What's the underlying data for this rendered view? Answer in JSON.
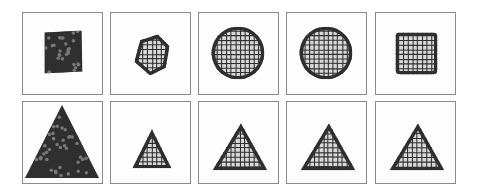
{
  "figure": {
    "ink_color": "#2f2f2f",
    "frame_color": "#8a8a8a",
    "rows": [
      {
        "target_shape": "square-to-circle",
        "panels": [
          {
            "x": 22,
            "y": 12,
            "shape": "noisy-square",
            "stage": "random"
          },
          {
            "x": 110,
            "y": 12,
            "shape": "blob",
            "stage": "early"
          },
          {
            "x": 198,
            "y": 12,
            "shape": "circle",
            "stage": "mid"
          },
          {
            "x": 286,
            "y": 12,
            "shape": "circle",
            "stage": "late"
          },
          {
            "x": 375,
            "y": 12,
            "shape": "rounded-square",
            "stage": "final"
          }
        ]
      },
      {
        "target_shape": "triangle",
        "panels": [
          {
            "x": 22,
            "y": 101,
            "shape": "big-triangle",
            "stage": "random"
          },
          {
            "x": 110,
            "y": 101,
            "shape": "small-triangle",
            "stage": "early"
          },
          {
            "x": 198,
            "y": 101,
            "shape": "triangle",
            "stage": "mid"
          },
          {
            "x": 286,
            "y": 101,
            "shape": "triangle",
            "stage": "late"
          },
          {
            "x": 375,
            "y": 101,
            "shape": "triangle",
            "stage": "final"
          }
        ]
      }
    ]
  }
}
